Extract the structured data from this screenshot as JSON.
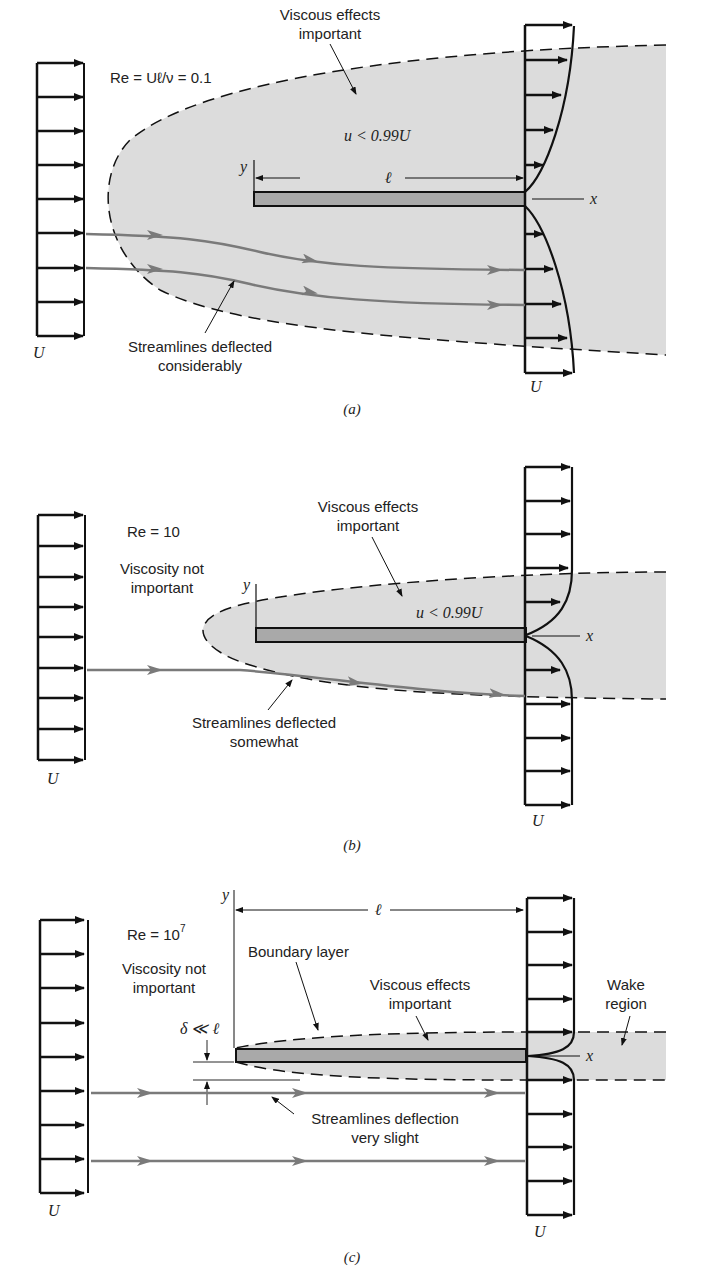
{
  "panels": [
    {
      "id": "a",
      "caption": "(a)",
      "reynolds": "Re = Uℓ/ν = 0.1",
      "viscous_label": [
        "Viscous effects",
        "important"
      ],
      "velocity_condition": "u < 0.99U",
      "streamline_label": [
        "Streamlines deflected",
        "considerably"
      ],
      "axis_x": "x",
      "axis_y": "y",
      "length": "ℓ",
      "upstream_U": "U",
      "downstream_U": "U"
    },
    {
      "id": "b",
      "caption": "(b)",
      "reynolds": "Re =  10",
      "viscosity_note": [
        "Viscosity not",
        "important"
      ],
      "viscous_label": [
        "Viscous effects",
        "important"
      ],
      "velocity_condition": "u < 0.99U",
      "streamline_label": [
        "Streamlines deflected",
        "somewhat"
      ],
      "axis_x": "x",
      "axis_y": "y",
      "upstream_U": "U",
      "downstream_U": "U"
    },
    {
      "id": "c",
      "caption": "(c)",
      "reynolds_base": "Re =  10",
      "reynolds_exp": "7",
      "viscosity_note": [
        "Viscosity not",
        "important"
      ],
      "boundary_label": "Boundary layer",
      "viscous_label": [
        "Viscous effects",
        "important"
      ],
      "wake_label": [
        "Wake",
        "region"
      ],
      "delta_label": "δ ≪ ℓ",
      "streamline_label": [
        "Streamlines deflection",
        "very slight"
      ],
      "axis_x": "x",
      "axis_y": "y",
      "length": "ℓ",
      "upstream_U": "U",
      "downstream_U": "U"
    }
  ],
  "colors": {
    "shade": "#dcdcdc",
    "plate": "#a9a9a9",
    "streamline": "#7a7a7a",
    "ink": "#111111"
  }
}
